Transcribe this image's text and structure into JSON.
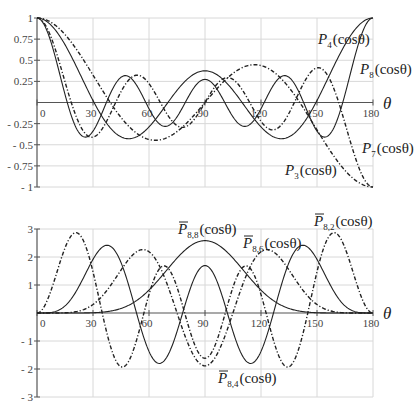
{
  "chart_data": [
    {
      "type": "line",
      "title": "",
      "xlabel": "θ",
      "ylabel": "",
      "xlim": [
        0,
        180
      ],
      "ylim": [
        -1,
        1
      ],
      "x_ticks": [
        "0",
        "30",
        "60",
        "90",
        "120",
        "150",
        "180"
      ],
      "y_ticks": [
        "1",
        "0.75",
        "0.5",
        "0.25",
        "-0.25",
        "-0.5",
        "-0.75",
        "-1"
      ],
      "grid": true,
      "x": [
        0,
        10,
        20,
        30,
        40,
        50,
        60,
        70,
        80,
        90,
        100,
        110,
        120,
        130,
        140,
        150,
        160,
        170,
        180
      ],
      "series": [
        {
          "name": "P3(cosθ)",
          "style": "dashdot",
          "degree": 3,
          "order": 0,
          "values": [
            1.0,
            0.91,
            0.67,
            0.32,
            -0.04,
            -0.32,
            -0.44,
            -0.39,
            -0.25,
            0.0,
            0.25,
            0.39,
            0.44,
            0.32,
            0.04,
            -0.32,
            -0.67,
            -0.91,
            -1.0
          ]
        },
        {
          "name": "P4(cosθ)",
          "style": "solid",
          "degree": 4,
          "order": 0,
          "values": [
            1.0,
            0.85,
            0.47,
            0.02,
            -0.31,
            -0.42,
            -0.29,
            -0.03,
            0.23,
            0.38,
            0.23,
            -0.03,
            -0.29,
            -0.42,
            -0.31,
            0.02,
            0.47,
            0.85,
            1.0
          ]
        },
        {
          "name": "P7(cosθ)",
          "style": "dashdot",
          "degree": 7,
          "order": 0,
          "values": [
            1.0,
            0.59,
            -0.26,
            -0.41,
            0.21,
            0.26,
            -0.23,
            -0.16,
            0.24,
            0.0,
            -0.24,
            0.16,
            0.23,
            -0.26,
            -0.21,
            0.41,
            0.26,
            -0.59,
            -1.0
          ]
        },
        {
          "name": "P8(cosθ)",
          "style": "solid",
          "degree": 8,
          "order": 0,
          "values": [
            1.0,
            0.46,
            -0.39,
            -0.04,
            0.3,
            -0.15,
            -0.25,
            0.23,
            0.13,
            -0.27,
            0.13,
            0.23,
            -0.25,
            -0.15,
            0.3,
            -0.04,
            -0.39,
            0.46,
            1.0
          ]
        }
      ]
    },
    {
      "type": "line",
      "title": "",
      "xlabel": "θ",
      "ylabel": "",
      "xlim": [
        0,
        180
      ],
      "ylim": [
        -3,
        3
      ],
      "x_ticks": [
        "0",
        "30",
        "60",
        "90",
        "120",
        "150",
        "180"
      ],
      "y_ticks": [
        "3",
        "2",
        "1",
        "-1",
        "-2",
        "-3"
      ],
      "grid": true,
      "x": [
        0,
        10,
        20,
        30,
        40,
        50,
        60,
        70,
        80,
        90,
        100,
        110,
        120,
        130,
        140,
        150,
        160,
        170,
        180
      ],
      "series": [
        {
          "name": "P̄8,2(cosθ)",
          "style": "dashdot",
          "degree": 8,
          "order": 2,
          "values": [
            0.0,
            1.93,
            2.85,
            0.45,
            -1.74,
            -1.6,
            0.87,
            1.38,
            -0.73,
            -1.66,
            -0.73,
            1.38,
            0.87,
            -1.6,
            -1.74,
            0.45,
            2.85,
            1.93,
            0.0
          ]
        },
        {
          "name": "P̄8,4(cosθ)",
          "style": "solid",
          "degree": 8,
          "order": 4,
          "values": [
            0.0,
            0.1,
            1.0,
            2.25,
            2.14,
            0.22,
            -1.5,
            -1.69,
            0.26,
            1.65,
            0.26,
            -1.69,
            -1.5,
            0.22,
            2.14,
            2.25,
            1.0,
            0.1,
            0.0
          ]
        },
        {
          "name": "P̄8,6(cosθ)",
          "style": "dashdot",
          "degree": 8,
          "order": 6,
          "values": [
            0.0,
            0.0,
            0.06,
            0.42,
            1.31,
            2.13,
            1.98,
            0.39,
            -1.33,
            -1.9,
            -1.33,
            0.39,
            1.98,
            2.13,
            1.31,
            0.42,
            0.06,
            0.0,
            0.0
          ]
        },
        {
          "name": "P̄8,8(cosθ)",
          "style": "solid",
          "degree": 8,
          "order": 8,
          "values": [
            0.0,
            0.0,
            0.0,
            0.01,
            0.07,
            0.3,
            0.79,
            1.55,
            2.3,
            2.55,
            2.3,
            1.55,
            0.79,
            0.3,
            0.07,
            0.01,
            0.0,
            0.0,
            0.0
          ]
        }
      ]
    }
  ],
  "labels": {
    "top": [
      {
        "main": "P",
        "sub": "4",
        "arg": "(cosθ)",
        "bar": false
      },
      {
        "main": "P",
        "sub": "8",
        "arg": "(cosθ)",
        "bar": false
      },
      {
        "main": "P",
        "sub": "7",
        "arg": "(cosθ)",
        "bar": false
      },
      {
        "main": "P",
        "sub": "3",
        "arg": "(cosθ)",
        "bar": false
      }
    ],
    "bottom": [
      {
        "main": "P",
        "sub": "8,8",
        "arg": "(cosθ)",
        "bar": true
      },
      {
        "main": "P",
        "sub": "8,6",
        "arg": "(cosθ)",
        "bar": true
      },
      {
        "main": "P",
        "sub": "8,2",
        "arg": "(cosθ)",
        "bar": true
      },
      {
        "main": "P",
        "sub": "8,4",
        "arg": "(cosθ)",
        "bar": true
      }
    ]
  },
  "axis_symbol": "θ"
}
